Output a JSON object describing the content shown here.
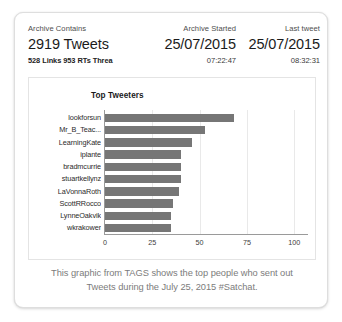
{
  "card": {
    "stats": {
      "archive_contains": {
        "caption": "Archive Contains",
        "main": "2919 Tweets",
        "sub": "528 Links 953 RTs Threa"
      },
      "archive_started": {
        "caption": "Archive Started",
        "main": "25/07/2015",
        "sub": "07:22:47"
      },
      "last_tweet": {
        "caption": "Last tweet",
        "main": "25/07/2015",
        "sub": "08:32:31"
      }
    },
    "caption_line_1": "This graphic from TAGS shows the top people who sent out",
    "caption_line_2": "Tweets during the July 25, 2015 #Satchat."
  },
  "chart_data": {
    "type": "bar",
    "orientation": "horizontal",
    "title": "Top Tweeters",
    "xlabel": "",
    "ylabel": "",
    "xlim": [
      0,
      108
    ],
    "grid": true,
    "legend": false,
    "bar_color": "#767676",
    "xticks": [
      "0",
      "25",
      "50",
      "75",
      "100"
    ],
    "xtick_values": [
      0,
      25,
      50,
      75,
      100
    ],
    "categories": [
      "lookforsun",
      "Mr_B_Teac...",
      "LearningKate",
      "iplante",
      "bradmcurrie",
      "stuartkellynz",
      "LaVonnaRoth",
      "ScottRRocco",
      "LynneOakvik",
      "wkrakower"
    ],
    "values": [
      68,
      53,
      46,
      40,
      40,
      40,
      39,
      36,
      35,
      35
    ]
  }
}
